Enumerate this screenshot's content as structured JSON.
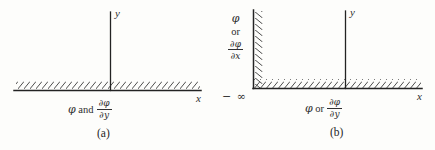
{
  "figure": {
    "kind": "boundary-condition-diagram",
    "ink_color": "#2b2b2b",
    "background_color": "#fdfdfb"
  },
  "panel_a": {
    "caption": "(a)",
    "x_axis_label": "x",
    "y_axis_label": "y",
    "boundary_condition": {
      "symbol": "φ",
      "connector": "and",
      "derivative_numerator": "∂φ",
      "derivative_denominator": "∂y"
    }
  },
  "panel_b": {
    "caption": "(b)",
    "x_axis_label": "x",
    "y_axis_label": "y",
    "left_limit_label": "− ∞",
    "wall_condition": {
      "symbol": "φ",
      "connector": "or",
      "derivative_numerator": "∂φ",
      "derivative_denominator": "∂x"
    },
    "floor_condition": {
      "symbol": "φ",
      "connector": "or",
      "derivative_numerator": "∂φ",
      "derivative_denominator": "∂y"
    }
  }
}
